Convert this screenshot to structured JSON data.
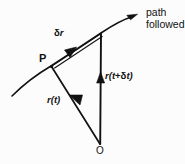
{
  "figure": {
    "kind": "vector-position-diagram",
    "background_color": "#fcfcfc",
    "ink_color": "#111111",
    "labels": {
      "point_p": "P",
      "origin": "O",
      "displacement": "δr",
      "displacement_delta": "δ",
      "displacement_r": "r",
      "position_t": "r(t)",
      "position_t_open": "r(",
      "position_t_var": "t",
      "position_t_close": ")",
      "position_t_dt_open": "r(",
      "position_t_dt_var1": "t",
      "position_t_dt_plus": "+",
      "position_t_dt_delta": "δ",
      "position_t_dt_var2": "t",
      "position_t_dt_close": ")",
      "position_t_dt": "r(t+δt)",
      "path_line1": "path",
      "path_line2": "followed"
    },
    "geometry": {
      "origin_point": [
        100,
        144
      ],
      "point_p": [
        51,
        66
      ],
      "point_q": [
        101,
        33
      ],
      "curve_tail": [
        12,
        96
      ],
      "curve_head": [
        136,
        16
      ]
    }
  }
}
